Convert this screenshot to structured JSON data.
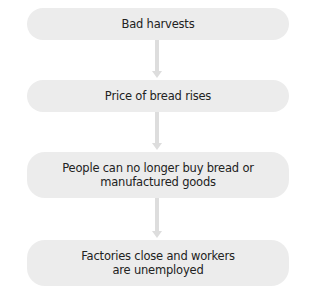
{
  "diagram": {
    "type": "flowchart",
    "direction": "top-to-bottom",
    "colors": {
      "box_fill": "#ececec",
      "arrow": "#dddddd",
      "text": "#222222"
    },
    "steps": [
      {
        "label": "Bad harvests"
      },
      {
        "label": "Price of bread rises"
      },
      {
        "label_line1": "People can no longer buy bread or",
        "label_line2": "manufactured goods"
      },
      {
        "label_line1": "Factories close and workers",
        "label_line2": "are unemployed"
      }
    ],
    "connections": [
      {
        "from": 0,
        "to": 1
      },
      {
        "from": 1,
        "to": 2
      },
      {
        "from": 2,
        "to": 3
      }
    ]
  }
}
